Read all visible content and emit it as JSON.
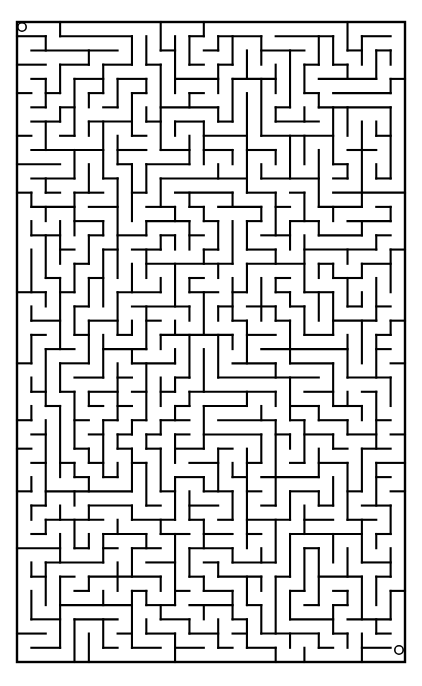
{
  "page": {
    "background_color": "#ffffff",
    "width": 422,
    "height": 686
  },
  "maze": {
    "type": "perfect-maze",
    "columns": 27,
    "rows": 45,
    "cell_size_px": 14.37,
    "origin_x_px": 17,
    "origin_y_px": 22,
    "grid_width_px": 388,
    "grid_height_px": 640,
    "wall_color": "#000000",
    "wall_thickness_px": 2.1,
    "border_thickness_px": 2.4,
    "passage_color": "#ffffff",
    "seed": 20240517,
    "start": {
      "label": "start",
      "marker": "circle",
      "column": 0,
      "row": 0,
      "center_x_px": 22,
      "center_y_px": 27,
      "radius_px": 4.2
    },
    "end": {
      "label": "finish",
      "marker": "circle",
      "column": 26,
      "row": 44,
      "center_x_px": 399,
      "center_y_px": 650,
      "radius_px": 4.2
    },
    "openings": []
  }
}
